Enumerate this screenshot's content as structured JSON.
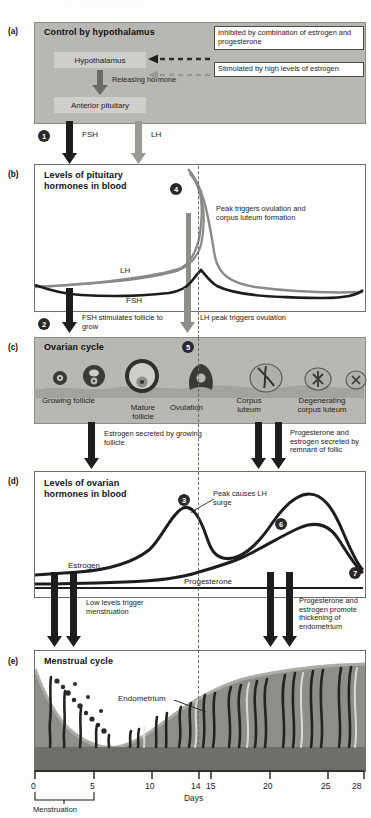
{
  "figure": {
    "panels": [
      {
        "letter": "(a)",
        "title": "Control by hypothalamus",
        "boxes": [
          {
            "label": "Hypothalamus"
          },
          {
            "label": "Anterior pituitary"
          }
        ],
        "arrow_label": "Releasing hormone",
        "callouts": [
          "Inhibited by combination of estrogen and progesterone",
          "Stimulated by high levels of estrogen"
        ],
        "outputs": [
          {
            "label": "FSH",
            "step": "1"
          },
          {
            "label": "LH"
          }
        ]
      },
      {
        "letter": "(b)",
        "title": "Levels of pituitary hormones in blood",
        "step": "4",
        "annotation": "Peak triggers ovulation and corpus luteum formation",
        "curves": [
          {
            "name": "LH"
          },
          {
            "name": "FSH"
          }
        ],
        "below_labels": [
          {
            "step": "2",
            "text": "FSH stimulates follicle to grow"
          },
          {
            "text": "LH peak triggers ovulation"
          }
        ]
      },
      {
        "letter": "(c)",
        "title": "Ovarian cycle",
        "step": "5",
        "stage_labels": [
          "Growing follicle",
          "Mature follicle",
          "Ovulation",
          "Corpus luteum",
          "Degenerating corpus luteum"
        ],
        "below_labels": [
          "Estrogen secreted by growing follicle",
          "Progesterone and estrogen secreted by remnant of follic"
        ]
      },
      {
        "letter": "(d)",
        "title": "Levels of ovarian hormones in blood",
        "annotation": "Peak causes LH surge",
        "steps": [
          "3",
          "6",
          "7"
        ],
        "curves": [
          {
            "name": "Estrogen"
          },
          {
            "name": "Progesterone"
          }
        ],
        "below_labels": [
          "Low levels trigger menstruation",
          "Progesterone and estrogen promote thickening of endometrium"
        ]
      },
      {
        "letter": "(e)",
        "title": "Menstrual cycle",
        "inner_label": "Endometrium"
      }
    ],
    "axis": {
      "label": "Days",
      "ticks": [
        "0",
        "5",
        "10",
        "14",
        "15",
        "20",
        "25",
        "28"
      ],
      "bracket_label": "Menstruation"
    },
    "colors": {
      "panel_gray": "#b8b7b2",
      "box_gray": "#cfcecb",
      "curve_dark": "#1d1d1b",
      "curve_light": "#8a8a86",
      "arrow_dark": "#1d1d1b",
      "arrow_gray": "#8e8e8a",
      "tissue_gray": "#8e8d88"
    }
  }
}
